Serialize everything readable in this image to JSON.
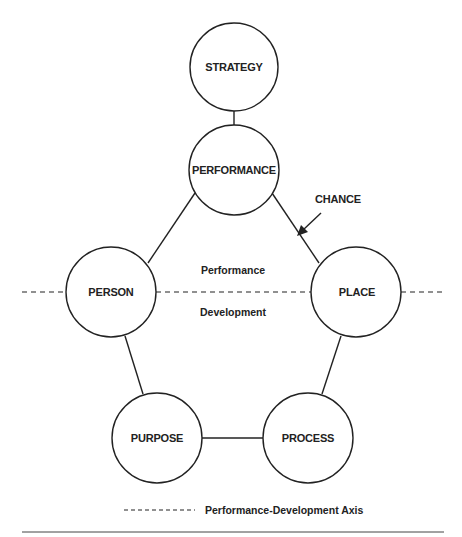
{
  "diagram": {
    "nodes": {
      "strategy": "STRATEGY",
      "performance": "PERFORMANCE",
      "person": "PERSON",
      "place": "PLACE",
      "purpose": "PURPOSE",
      "process": "PROCESS"
    },
    "annotations": {
      "chance": "CHANCE",
      "performance_region": "Performance",
      "development_region": "Development"
    },
    "legend": {
      "axis_label": "Performance-Development Axis"
    },
    "colors": {
      "stroke": "#222222",
      "background": "#ffffff"
    }
  }
}
